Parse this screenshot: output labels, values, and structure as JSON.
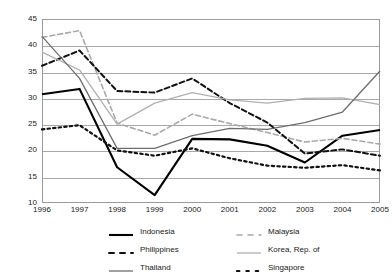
{
  "chart_data": {
    "type": "line",
    "title": "",
    "subtitle": "",
    "xlabel": "",
    "ylabel": "",
    "grid": true,
    "legend_position": "bottom",
    "x": [
      "1996",
      "1997",
      "1998",
      "1999",
      "2000",
      "2001",
      "2002",
      "2003",
      "2004",
      "2005"
    ],
    "xlim": [
      1996,
      2005
    ],
    "ylim": [
      10,
      45
    ],
    "yticks": [
      10,
      15,
      20,
      25,
      30,
      35,
      40,
      45
    ],
    "xticks": [
      "1996",
      "1997",
      "1998",
      "1999",
      "2000",
      "2001",
      "2002",
      "2003",
      "2004",
      "2005"
    ],
    "series": [
      {
        "name": "Indonesia",
        "color": "#000000",
        "width": 2.1,
        "dash": "none",
        "values": [
          30.7,
          31.7,
          16.8,
          11.5,
          22.2,
          22.1,
          20.9,
          17.7,
          22.8,
          23.9
        ]
      },
      {
        "name": "Malaysia",
        "color": "#a9a9a9",
        "width": 1.6,
        "dash": "5,3",
        "values": [
          41.5,
          42.8,
          25.2,
          22.9,
          26.9,
          25.1,
          23.4,
          21.6,
          22.3,
          21.2
        ]
      },
      {
        "name": "Philippines",
        "color": "#111111",
        "width": 2.0,
        "dash": "5,3",
        "values": [
          36.1,
          39.0,
          31.3,
          31.0,
          33.7,
          29.0,
          25.3,
          19.4,
          20.2,
          19.0
        ]
      },
      {
        "name": "Korea, Rep. of",
        "color": "#b0b0b0",
        "width": 1.3,
        "dash": "none",
        "values": [
          38.7,
          35.3,
          25.0,
          29.0,
          31.0,
          29.6,
          29.0,
          29.9,
          30.0,
          28.7
        ]
      },
      {
        "name": "Thailand",
        "color": "#6e6e6e",
        "width": 1.3,
        "dash": "none",
        "values": [
          41.7,
          33.7,
          20.4,
          20.4,
          22.8,
          24.2,
          24.0,
          25.3,
          27.3,
          35.1
        ]
      },
      {
        "name": "Singapore",
        "color": "#111111",
        "width": 2.2,
        "dash": "2.4,3.2",
        "values": [
          24.0,
          24.8,
          20.0,
          19.0,
          20.4,
          18.5,
          17.1,
          16.7,
          17.2,
          16.2
        ]
      }
    ]
  },
  "legend": {
    "items": [
      {
        "label": "Indonesia",
        "series": "Indonesia"
      },
      {
        "label": "Malaysia",
        "series": "Malaysia"
      },
      {
        "label": "Philippines",
        "series": "Philippines"
      },
      {
        "label": "Korea, Rep. of",
        "series": "Korea, Rep. of"
      },
      {
        "label": "Thailand",
        "series": "Thailand"
      },
      {
        "label": "Singapore",
        "series": "Singapore"
      }
    ]
  },
  "colors": {
    "axis": "#9a9a9a",
    "grid": "#a8a8a8",
    "text": "#1a1a1a",
    "background": "#ffffff"
  }
}
